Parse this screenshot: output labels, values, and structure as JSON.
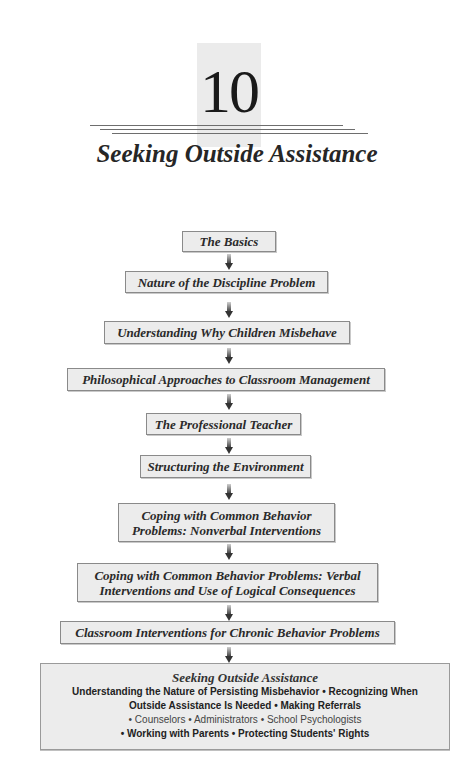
{
  "chapter": {
    "number": "10",
    "title": "Seeking Outside Assistance"
  },
  "flow": {
    "steps": [
      {
        "line1": "The Basics"
      },
      {
        "line1": "Nature of the Discipline Problem"
      },
      {
        "line1": "Understanding Why Children Misbehave"
      },
      {
        "line1": "Philosophical Approaches to Classroom Management"
      },
      {
        "line1": "The Professional Teacher"
      },
      {
        "line1": "Structuring the Environment"
      },
      {
        "line1": "Coping with Common Behavior",
        "line2": "Problems: Nonverbal Interventions"
      },
      {
        "line1": "Coping with Common Behavior Problems: Verbal",
        "line2": "Interventions and Use of Logical Consequences"
      },
      {
        "line1": "Classroom Interventions for Chronic Behavior Problems"
      }
    ],
    "final": {
      "title": "Seeking Outside Assistance",
      "lines": [
        "Understanding the Nature of Persisting Misbehavior  •  Recognizing When",
        "Outside Assistance Is Needed  •  Making Referrals",
        "•  Counselors  •  Administrators  •  School Psychologists",
        "•  Working with Parents  •  Protecting Students' Rights"
      ]
    }
  }
}
